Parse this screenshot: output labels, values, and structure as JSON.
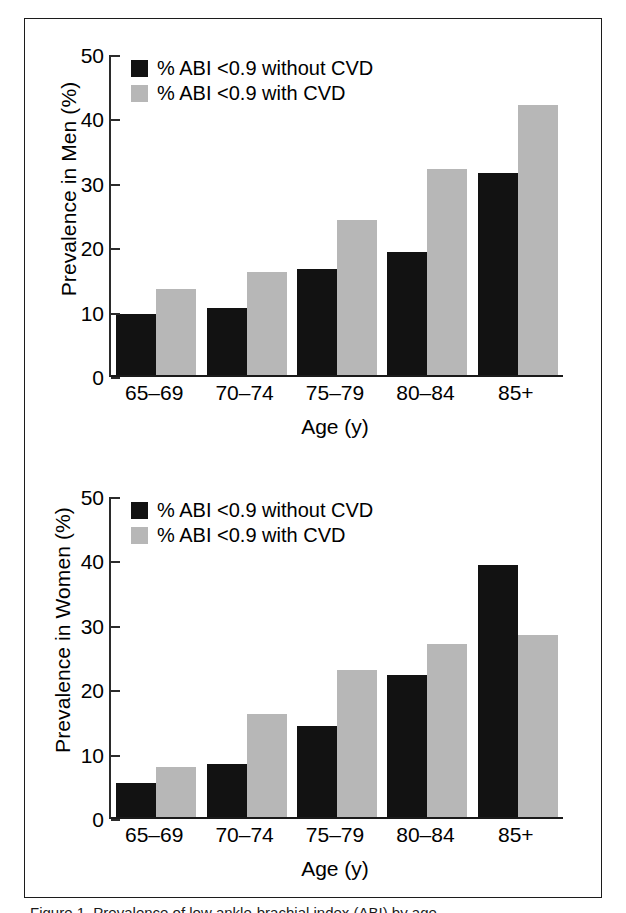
{
  "figure": {
    "caption_partial": "Figure 1. Prevalence of low ankle-brachial index (ABI) by age",
    "legend": {
      "without_cvd": "% ABI <0.9 without CVD",
      "with_cvd": "% ABI <0.9 with CVD"
    },
    "colors": {
      "without_cvd": "#121212",
      "with_cvd": "#b7b7b7",
      "axis": "#1a1a1a",
      "background": "#ffffff"
    }
  },
  "chart_data": [
    {
      "type": "bar",
      "title": "",
      "xlabel": "Age (y)",
      "ylabel": "Prevalence in Men (%)",
      "categories": [
        "65–69",
        "70–74",
        "75–79",
        "80–84",
        "85+"
      ],
      "series": [
        {
          "name": "% ABI <0.9 without CVD",
          "color": "#121212",
          "values": [
            9.4,
            10.4,
            16.5,
            19.1,
            31.3
          ]
        },
        {
          "name": "% ABI <0.9 with CVD",
          "color": "#b7b7b7",
          "values": [
            13.3,
            16.0,
            24.0,
            32.0,
            42.0
          ]
        }
      ],
      "ylim": [
        0,
        50
      ],
      "yticks": [
        0,
        10,
        20,
        30,
        40,
        50
      ],
      "grid": false,
      "legend_position": "top-left"
    },
    {
      "type": "bar",
      "title": "",
      "xlabel": "Age (y)",
      "ylabel": "Prevalence in Women (%)",
      "categories": [
        "65–69",
        "70–74",
        "75–79",
        "80–84",
        "85+"
      ],
      "series": [
        {
          "name": "% ABI <0.9 without CVD",
          "color": "#121212",
          "values": [
            5.3,
            8.2,
            14.1,
            22.0,
            39.2
          ]
        },
        {
          "name": "% ABI <0.9 with CVD",
          "color": "#b7b7b7",
          "values": [
            7.7,
            16.0,
            22.8,
            26.8,
            28.2
          ]
        }
      ],
      "ylim": [
        0,
        50
      ],
      "yticks": [
        0,
        10,
        20,
        30,
        40,
        50
      ],
      "grid": false,
      "legend_position": "top-left"
    }
  ]
}
